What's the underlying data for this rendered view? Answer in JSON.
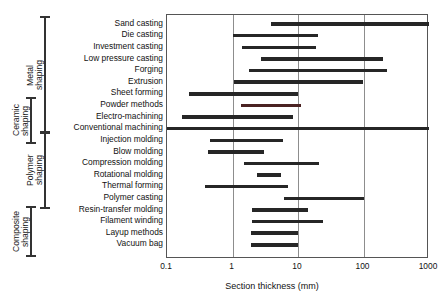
{
  "chart_data": {
    "type": "bar",
    "orientation": "horizontal-range",
    "title": "",
    "xlabel": "Section thickness (mm)",
    "ylabel": "",
    "xscale": "log",
    "xlim": [
      0.1,
      1000
    ],
    "xticks": [
      0.1,
      1,
      10,
      100,
      1000
    ],
    "xtick_labels": [
      "0.1",
      "1",
      "10",
      "100",
      "1000"
    ],
    "grid": "vertical",
    "legend": "none",
    "categories": [
      "Sand casting",
      "Die casting",
      "Investment casting",
      "Low pressure casting",
      "Forging",
      "Extrusion",
      "Sheet forming",
      "Powder methods",
      "Electro-machining",
      "Conventional machining",
      "Injection molding",
      "Blow molding",
      "Compression molding",
      "Rotational molding",
      "Thermal forming",
      "Polymer casting",
      "Resin-transfer molding",
      "Filament winding",
      "Layup methods",
      "Vacuum bag"
    ],
    "ranges": [
      [
        3.8,
        1000
      ],
      [
        1.0,
        20
      ],
      [
        1.4,
        19
      ],
      [
        2.7,
        200
      ],
      [
        1.8,
        230
      ],
      [
        1.05,
        100
      ],
      [
        0.22,
        10
      ],
      [
        1.35,
        11
      ],
      [
        0.17,
        8.5
      ],
      [
        0.1,
        1000
      ],
      [
        0.45,
        6.0
      ],
      [
        0.42,
        3.0
      ],
      [
        1.5,
        21
      ],
      [
        2.4,
        5.6
      ],
      [
        0.38,
        7.0
      ],
      [
        6.0,
        100
      ],
      [
        2.0,
        14
      ],
      [
        2.0,
        24
      ],
      [
        1.9,
        10
      ],
      [
        1.9,
        10
      ]
    ],
    "highlighted_bar": "Powder methods",
    "groups": [
      {
        "label": "Metal\nshaping",
        "first": "Sand casting",
        "last": "Conventional machining"
      },
      {
        "label": "Ceramic\nshaping",
        "first": "Powder methods",
        "last": "Injection molding"
      },
      {
        "label": "Polymer\nshaping",
        "first": "Conventional machining",
        "last": "Resin-transfer molding"
      },
      {
        "label": "Composite\nshaping",
        "first": "Resin-transfer molding",
        "last": "Vacuum bag"
      }
    ],
    "colors": {
      "bar": "#262626",
      "bar_highlight": "#4a2222",
      "gridline": "#8d8d8d",
      "axis": "#555555",
      "text": "#111111"
    }
  },
  "axis": {
    "title": "Section thickness (mm)"
  }
}
